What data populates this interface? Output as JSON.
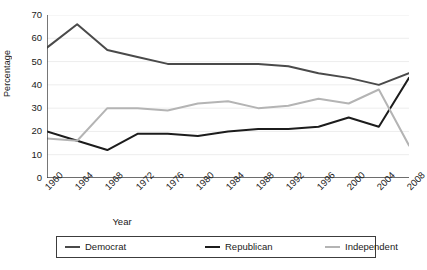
{
  "chart_data": {
    "type": "line",
    "title": "",
    "xlabel": "Year",
    "ylabel": "Percentage",
    "x": [
      1960,
      1964,
      1968,
      1972,
      1976,
      1980,
      1984,
      1988,
      1992,
      1996,
      2000,
      2004,
      2008
    ],
    "categories": [
      "1960",
      "1964",
      "1968",
      "1972",
      "1976",
      "1980",
      "1984",
      "1988",
      "1992",
      "1996",
      "2000",
      "2004",
      "2008"
    ],
    "xlim": [
      1960,
      2008
    ],
    "ylim": [
      0,
      70
    ],
    "yticks": [
      0,
      10,
      20,
      30,
      40,
      50,
      60,
      70
    ],
    "ytick_labels": [
      "0",
      "10",
      "20",
      "30",
      "40",
      "50",
      "60",
      "70"
    ],
    "grid": true,
    "grid_axis": "y",
    "legend_position": "bottom",
    "series": [
      {
        "name": "Democrat",
        "color": "#4a4a4a",
        "values": [
          56,
          66,
          55,
          52,
          49,
          49,
          49,
          49,
          48,
          45,
          43,
          40,
          45
        ]
      },
      {
        "name": "Republican",
        "color": "#1c1c1c",
        "values": [
          20,
          16,
          12,
          19,
          19,
          18,
          20,
          21,
          21,
          22,
          26,
          22,
          43
        ]
      },
      {
        "name": "Independent",
        "color": "#b4b4b4",
        "values": [
          17,
          16,
          30,
          30,
          29,
          32,
          33,
          30,
          31,
          34,
          32,
          38,
          14
        ]
      }
    ]
  },
  "axes": {
    "y_title": "Percentage",
    "x_title": "Year"
  },
  "legend": {
    "items": [
      {
        "label": "Democrat",
        "color": "#4a4a4a"
      },
      {
        "label": "Republican",
        "color": "#1c1c1c"
      },
      {
        "label": "Independent",
        "color": "#b4b4b4"
      }
    ]
  }
}
